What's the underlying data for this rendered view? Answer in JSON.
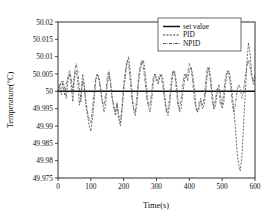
{
  "chart_data": {
    "type": "line",
    "title": "",
    "xlabel": "Time(s)",
    "ylabel": "Temperature(°C)",
    "xlim": [
      0,
      600
    ],
    "ylim": [
      49.975,
      50.02
    ],
    "xticks": [
      0,
      100,
      200,
      300,
      400,
      500,
      600
    ],
    "xtick_labels": [
      "0",
      "100",
      "200",
      "300",
      "400",
      "500",
      "600"
    ],
    "yticks": [
      49.975,
      49.98,
      49.985,
      49.99,
      49.995,
      50,
      50.005,
      50.01,
      50.015,
      50.02
    ],
    "ytick_labels": [
      "49.975",
      "49.98",
      "49.985",
      "49.99",
      "49.995",
      "50",
      "50.005",
      "50.01",
      "50.015",
      "50.02"
    ],
    "grid": false,
    "legend_position": "upper-right",
    "legend": [
      "set value",
      "PID",
      "NPID"
    ],
    "series": [
      {
        "name": "set value",
        "style": "solid",
        "color": "#111111",
        "x": [
          0,
          600
        ],
        "values": [
          50,
          50
        ]
      },
      {
        "name": "PID",
        "style": "dashed",
        "color": "#3a3a3a",
        "x": [
          0,
          5,
          10,
          15,
          20,
          25,
          30,
          35,
          40,
          45,
          50,
          55,
          60,
          65,
          70,
          75,
          80,
          85,
          90,
          95,
          100,
          105,
          110,
          115,
          120,
          125,
          130,
          135,
          140,
          145,
          150,
          155,
          160,
          165,
          170,
          175,
          180,
          185,
          190,
          195,
          200,
          205,
          210,
          215,
          220,
          225,
          230,
          235,
          240,
          245,
          250,
          255,
          260,
          265,
          270,
          275,
          280,
          285,
          290,
          295,
          300,
          305,
          310,
          315,
          320,
          325,
          330,
          335,
          340,
          345,
          350,
          355,
          360,
          365,
          370,
          375,
          380,
          385,
          390,
          395,
          400,
          405,
          410,
          415,
          420,
          425,
          430,
          435,
          440,
          445,
          450,
          455,
          460,
          465,
          470,
          475,
          480,
          485,
          490,
          495,
          500,
          505,
          510,
          515,
          520,
          525,
          530,
          535,
          540,
          545,
          550,
          555,
          560,
          565,
          570,
          575,
          580,
          585,
          590,
          595,
          600
        ],
        "values": [
          50.0,
          50.002,
          49.999,
          50.003,
          50.001,
          49.998,
          50.003,
          50.005,
          50.002,
          49.997,
          50.004,
          50.006,
          50.003,
          49.996,
          49.999,
          50.005,
          50.002,
          49.996,
          49.993,
          49.99,
          49.9885,
          49.992,
          49.997,
          50.003,
          50.005,
          50.004,
          50.001,
          49.997,
          49.994,
          49.996,
          50.002,
          50.005,
          50.003,
          49.998,
          49.995,
          49.993,
          49.996,
          49.992,
          49.99,
          49.994,
          50.0,
          50.004,
          50.008,
          50.01,
          50.006,
          50.0,
          49.995,
          49.993,
          49.996,
          50.002,
          50.006,
          50.008,
          50.009,
          50.006,
          50.001,
          49.996,
          49.994,
          49.997,
          50.002,
          50.005,
          50.004,
          50.002,
          50.004,
          50.005,
          50.003,
          49.999,
          49.995,
          49.993,
          49.996,
          50.001,
          50.005,
          50.006,
          50.003,
          49.998,
          49.994,
          49.995,
          49.999,
          50.003,
          50.005,
          50.003,
          50.006,
          50.007,
          50.005,
          50.001,
          49.996,
          49.994,
          49.995,
          49.998,
          49.995,
          49.996,
          50.0,
          50.005,
          50.007,
          50.004,
          49.999,
          49.995,
          49.996,
          50.0,
          50.002,
          49.999,
          49.995,
          49.997,
          50.002,
          50.005,
          50.006,
          50.004,
          50.0,
          49.995,
          49.99,
          49.983,
          49.979,
          49.977,
          49.981,
          49.99,
          49.999,
          50.008,
          50.014,
          50.011,
          50.005,
          50.002,
          50.004
        ]
      },
      {
        "name": "NPID",
        "style": "dash-dot",
        "color": "#4a4a4a",
        "x": [
          0,
          5,
          10,
          15,
          20,
          25,
          30,
          35,
          40,
          45,
          50,
          55,
          60,
          65,
          70,
          75,
          80,
          85,
          90,
          95,
          100,
          105,
          110,
          115,
          120,
          125,
          130,
          135,
          140,
          145,
          150,
          155,
          160,
          165,
          170,
          175,
          180,
          185,
          190,
          195,
          200,
          205,
          210,
          215,
          220,
          225,
          230,
          235,
          240,
          245,
          250,
          255,
          260,
          265,
          270,
          275,
          280,
          285,
          290,
          295,
          300,
          305,
          310,
          315,
          320,
          325,
          330,
          335,
          340,
          345,
          350,
          355,
          360,
          365,
          370,
          375,
          380,
          385,
          390,
          395,
          400,
          405,
          410,
          415,
          420,
          425,
          430,
          435,
          440,
          445,
          450,
          455,
          460,
          465,
          470,
          475,
          480,
          485,
          490,
          495,
          500,
          505,
          510,
          515,
          520,
          525,
          530,
          535,
          540,
          545,
          550,
          555,
          560,
          565,
          570,
          575,
          580,
          585,
          590,
          595,
          600
        ],
        "values": [
          50.0,
          50.001,
          50.003,
          50.002,
          49.999,
          50.002,
          50.004,
          50.006,
          50.004,
          50.0,
          50.005,
          50.008,
          50.006,
          50.001,
          49.997,
          50.003,
          50.001,
          49.997,
          49.994,
          49.992,
          49.991,
          49.995,
          50.0,
          50.004,
          50.005,
          50.003,
          50.0,
          49.997,
          49.996,
          49.999,
          50.004,
          50.006,
          50.002,
          49.998,
          49.996,
          49.994,
          49.997,
          49.993,
          49.991,
          49.996,
          50.002,
          50.006,
          50.009,
          50.008,
          50.003,
          49.998,
          49.995,
          49.994,
          49.998,
          50.004,
          50.007,
          50.009,
          50.007,
          50.003,
          49.998,
          49.996,
          49.996,
          50.0,
          50.004,
          50.005,
          50.003,
          50.003,
          50.005,
          50.004,
          50.001,
          49.997,
          49.994,
          49.995,
          49.998,
          50.003,
          50.006,
          50.005,
          50.001,
          49.996,
          49.995,
          49.998,
          50.002,
          50.005,
          50.004,
          50.005,
          50.008,
          50.007,
          50.003,
          49.998,
          49.995,
          49.994,
          49.997,
          49.997,
          49.996,
          49.998,
          50.003,
          50.007,
          50.006,
          50.002,
          49.997,
          49.995,
          49.998,
          50.001,
          50.0,
          49.996,
          49.996,
          50.0,
          50.004,
          50.006,
          50.005,
          50.002,
          49.997,
          49.994,
          49.996,
          50.0,
          50.002,
          50.001,
          49.998,
          50.0,
          50.004,
          50.007,
          50.009,
          50.007,
          50.004,
          50.003,
          50.005
        ]
      }
    ]
  }
}
